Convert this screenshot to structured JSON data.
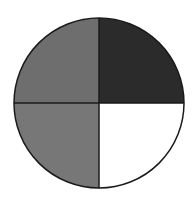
{
  "diagram": {
    "type": "quartered-circle",
    "center": {
      "x": 99,
      "y": 103
    },
    "radius": 85,
    "stroke_color": "#1a1a1a",
    "stroke_width": 1.5,
    "quadrants": [
      {
        "name": "top-left",
        "fill": "#6e6e6e"
      },
      {
        "name": "top-right",
        "fill": "#2b2b2b"
      },
      {
        "name": "bottom-left",
        "fill": "#777777"
      },
      {
        "name": "bottom-right",
        "fill": "#ffffff"
      }
    ]
  }
}
